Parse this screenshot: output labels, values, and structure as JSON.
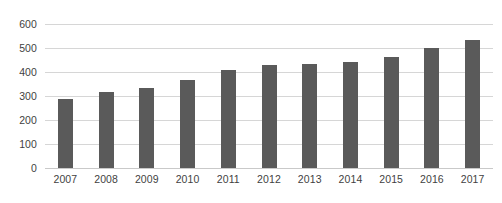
{
  "chart_data": {
    "type": "bar",
    "title": "",
    "subtitle": "",
    "xlabel": "",
    "ylabel": "",
    "categories": [
      "2007",
      "2008",
      "2009",
      "2010",
      "2011",
      "2012",
      "2013",
      "2014",
      "2015",
      "2016",
      "2017"
    ],
    "values": [
      288,
      318,
      333,
      368,
      410,
      430,
      435,
      440,
      462,
      498,
      532
    ],
    "series": [
      {
        "name": "",
        "values": [
          288,
          318,
          333,
          368,
          410,
          430,
          435,
          440,
          462,
          498,
          532
        ]
      }
    ],
    "ylim": [
      0,
      600
    ],
    "y_ticks": [
      0,
      100,
      200,
      300,
      400,
      500,
      600
    ],
    "y_tick_labels": [
      "0",
      "100",
      "200",
      "300",
      "400",
      "500",
      "600"
    ],
    "grid": true,
    "grid_axis": "y",
    "legend": false,
    "legend_position": "none",
    "annotations": [],
    "colors": {
      "bar": "#5a5a5a",
      "gridline": "#d6d6d6",
      "baseline": "#c9c9c9",
      "tick_label": "#3f3f3f",
      "background": "#ffffff"
    }
  }
}
